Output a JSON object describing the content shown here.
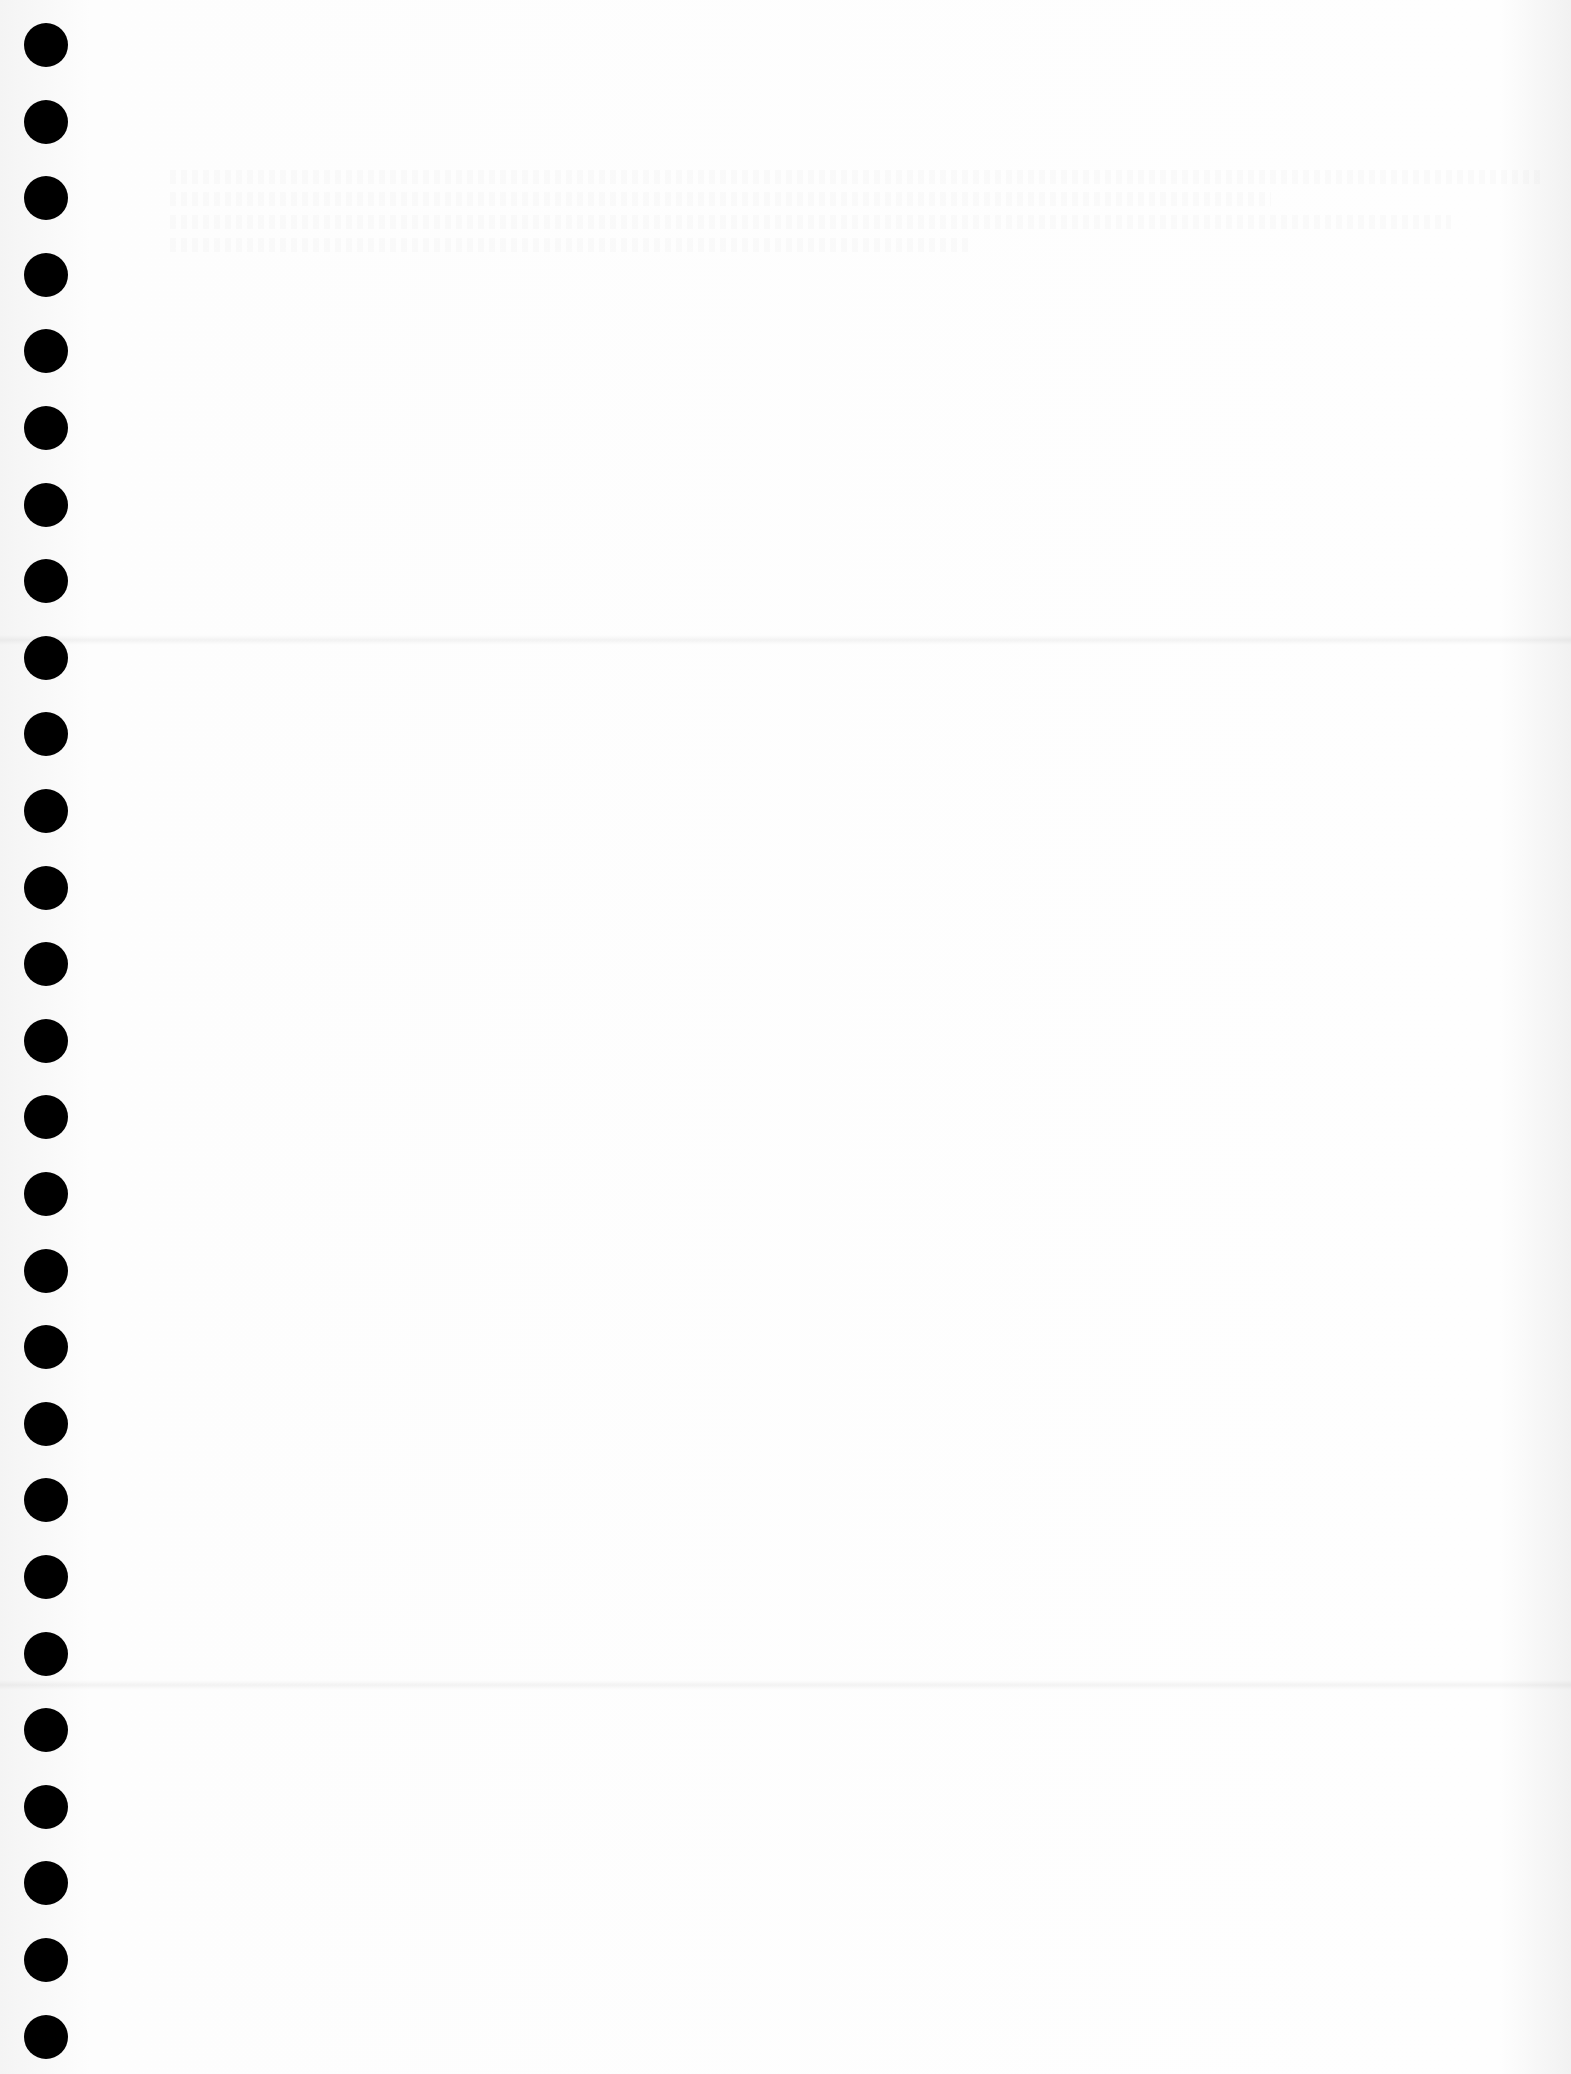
{
  "page": {
    "type": "blank continuous-form paper",
    "background_color": "#fbfbfb",
    "hole_color": "#000000"
  },
  "punch_holes": {
    "count": 27,
    "x_center": 46,
    "first_y_center": 45,
    "spacing": 76.6
  },
  "fold_lines": [
    {
      "y": 640
    },
    {
      "y": 1685
    }
  ],
  "text_content": []
}
